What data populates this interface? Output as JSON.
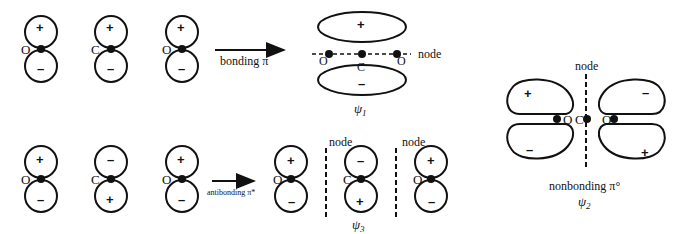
{
  "colors": {
    "ink": "#111111",
    "background": "#ffffff"
  },
  "top_row": {
    "atomic_orbitals": [
      {
        "atom": "O",
        "top_sign": "+",
        "bottom_sign": "–"
      },
      {
        "atom": "C",
        "top_sign": "+",
        "bottom_sign": "–"
      },
      {
        "atom": "O",
        "top_sign": "+",
        "bottom_sign": "–"
      }
    ],
    "arrow_label": "bonding π",
    "result": {
      "top_sign": "+",
      "bottom_sign": "–",
      "atoms": [
        "O",
        "C",
        "O"
      ],
      "node_label": "node",
      "psi_label": "ψ",
      "psi_sub": "1"
    }
  },
  "bottom_row": {
    "atomic_orbitals": [
      {
        "atom": "O",
        "top_sign": "+",
        "bottom_sign": "–"
      },
      {
        "atom": "C",
        "top_sign": "–",
        "bottom_sign": "+"
      },
      {
        "atom": "O",
        "top_sign": "+",
        "bottom_sign": "–"
      }
    ],
    "arrow_label": "antibonding π*",
    "result": {
      "orbitals": [
        {
          "atom": "O",
          "top_sign": "+",
          "bottom_sign": "–"
        },
        {
          "atom": "C",
          "top_sign": "–",
          "bottom_sign": "+"
        },
        {
          "atom": "O",
          "top_sign": "+",
          "bottom_sign": "–"
        }
      ],
      "node_labels": [
        "node",
        "node"
      ],
      "psi_label": "ψ",
      "psi_sub": "3"
    }
  },
  "nonbonding": {
    "node_label": "node",
    "lobes": {
      "upper_left": "+",
      "upper_right": "–",
      "lower_left": "–",
      "lower_right": "+"
    },
    "atoms": [
      "O",
      "C",
      "O"
    ],
    "caption": "nonbonding π°",
    "psi_label": "ψ",
    "psi_sub": "2"
  }
}
